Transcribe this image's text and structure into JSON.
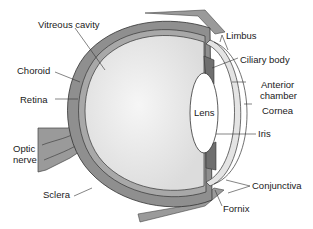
{
  "labels": {
    "vitreous_cavity": "Vitreous cavity",
    "choroid": "Choroid",
    "retina": "Retina",
    "optic_nerve_1": "Optic",
    "optic_nerve_2": "nerve",
    "sclera": "Sclera",
    "limbus": "Limbus",
    "ciliary_body": "Ciliary body",
    "anterior_chamber_1": "Anterior",
    "anterior_chamber_2": "chamber",
    "cornea": "Cornea",
    "iris": "Iris",
    "lens": "Lens",
    "conjunctiva": "Conjunctiva",
    "fornix": "Fornix"
  },
  "colors": {
    "sclera": "#8f8f8f",
    "vitreous": "#e8e8e8",
    "lens": "#ffffff",
    "outline": "#333333"
  }
}
